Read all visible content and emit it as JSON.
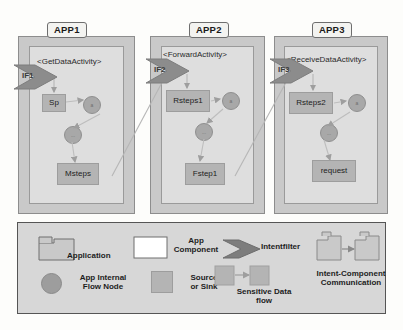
{
  "diagram": {
    "colors": {
      "app_outer": "#c9c9c9",
      "app_inner": "#dedede",
      "source_sink": "#b4b4b4",
      "flow_node": "#a8a8a8",
      "intent_filter": "#8c8c8c",
      "legend_bg": "#d7d7d7",
      "line": "#b0b0b0",
      "page_bg": "#fdfdfb"
    },
    "apps": [
      {
        "tab_label": "APP1",
        "component_label": "<GetDataActivity>",
        "intent_filter": "IF1",
        "source": "Sp",
        "sink": "Msteps",
        "nodes": [
          "a",
          "..."
        ]
      },
      {
        "tab_label": "APP2",
        "component_label": "<ForwardActivity>",
        "intent_filter": "IF2",
        "source": "Rsteps1",
        "sink": "Fstep1",
        "nodes": [
          "a",
          "..."
        ]
      },
      {
        "tab_label": "APP3",
        "component_label": "<ReceiveDataActivity>",
        "intent_filter": "IF3",
        "source": "Rsteps2",
        "sink": "request",
        "nodes": [
          "a",
          "..."
        ]
      }
    ],
    "connections": [
      {
        "from": "Msteps",
        "to": "IF2",
        "type": "intent-component-communication"
      },
      {
        "from": "Fstep1",
        "to": "IF3",
        "type": "intent-component-communication"
      }
    ]
  },
  "legend": {
    "items": [
      {
        "icon": "folder-icon",
        "label": "Application"
      },
      {
        "icon": "rectangle-outline-icon",
        "label": "App\nComponent"
      },
      {
        "icon": "chevron-arrow-icon",
        "label": "Intentfilter"
      },
      {
        "icon": "two-folders-arrow-icon",
        "label": "Intent-Component\nCommunication"
      },
      {
        "icon": "circle-icon",
        "label": "App Internal\nFlow Node"
      },
      {
        "icon": "gray-square-icon",
        "label": "Source\nor Sink"
      },
      {
        "icon": "two-squares-arrow-icon",
        "label": "Sensitive Data\nflow"
      }
    ]
  }
}
